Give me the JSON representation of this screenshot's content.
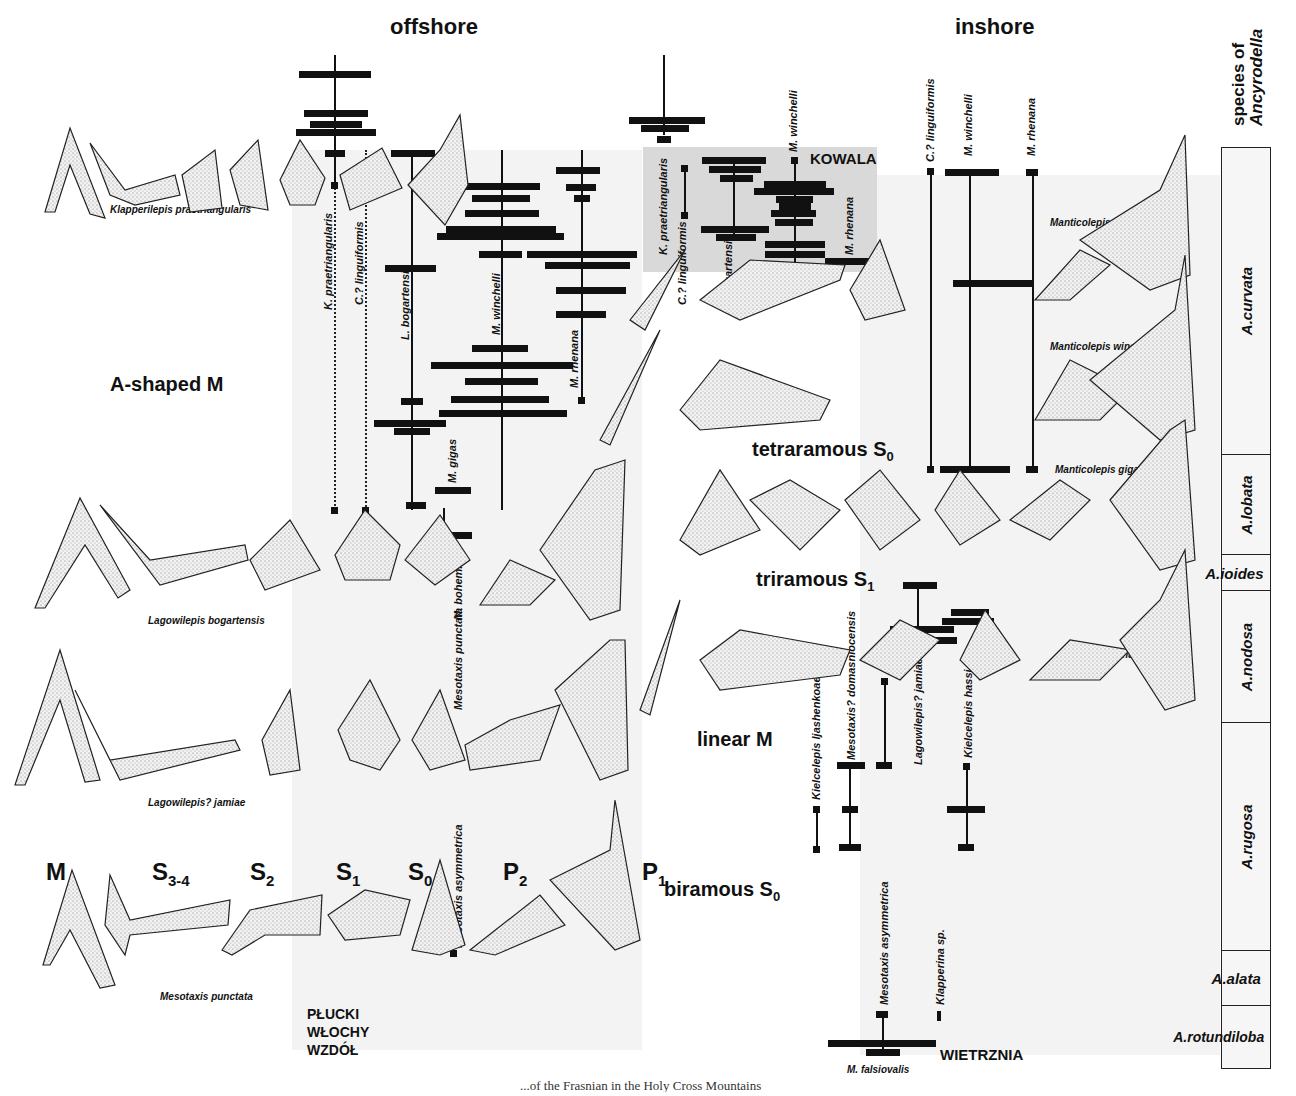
{
  "figure": {
    "headings": {
      "offshore": "offshore",
      "inshore": "inshore",
      "zone_column_title_line1": "species of",
      "zone_column_title_line2": "Ancyrodella"
    },
    "morphotype_labels": {
      "a_shaped_m": "A-shaped M",
      "tetraramous_s0": "tetraramous S",
      "tetraramous_s0_sub": "0",
      "triramous_s1": "triramous S",
      "triramous_s1_sub": "1",
      "linear_m": "linear M",
      "biramous_s0": "biramous S",
      "biramous_s0_sub": "0"
    },
    "element_labels": [
      {
        "main": "M",
        "sub": ""
      },
      {
        "main": "S",
        "sub": "3-4"
      },
      {
        "main": "S",
        "sub": "2"
      },
      {
        "main": "S",
        "sub": "1"
      },
      {
        "main": "S",
        "sub": "0"
      },
      {
        "main": "P",
        "sub": "2"
      },
      {
        "main": "P",
        "sub": "1"
      }
    ],
    "species_captions": {
      "klapperilepis": "Klapperilepis praetriangularis",
      "lagowilepis_bog": "Lagowilepis bogartensis",
      "lagowilepis_jam": "Lagowilepis? jamiae",
      "mesotaxis_punc": "Mesotaxis punctata",
      "manticolepis_rhen": "Manticolepis rhenana",
      "manticolepis_winch": "Manticolepis winchelli",
      "manticolepis_gigas": "Manticolepis gigas",
      "kielcelepis_hassi": "Kielcelepis hassi",
      "m_falsiovalis": "M. falsiovalis"
    },
    "localities": {
      "kowala": "KOWALA",
      "plucki": "PŁUCKI",
      "wlochy": "WŁOCHY",
      "wzdol": "WZDÓŁ",
      "wietrznia": "WIETRZNIA"
    },
    "range_labels": {
      "offshore": [
        "K. praetriangularis",
        "C.? linguiformis",
        "L. bogartensis",
        "M. winchelli",
        "M. rhenana",
        "M. gigas",
        "M. bohemica",
        "Mesotaxis punctata",
        "Mesotaxis asymmetrica"
      ],
      "kowala": [
        "K. praetriangularis",
        "C.? linguiformis",
        "L. bogartensis",
        "M. winchelli",
        "M. rhenana"
      ],
      "inshore": [
        "C.? linguiformis",
        "M. winchelli",
        "M. rhenana"
      ],
      "lower_inshore": [
        "Kielcelepis ljashenkoae",
        "Mesotaxis? domasniocensis",
        "Lagowilepis? jamiae",
        "Kielcelepis hassi"
      ],
      "wietrznia": [
        "Mesotaxis asymmetrica",
        "Klapperina sp."
      ]
    },
    "ancyrodella_zones": [
      {
        "name": "A.curvata"
      },
      {
        "name": "A.lobata"
      },
      {
        "name": "A.ioides"
      },
      {
        "name": "A.nodosa"
      },
      {
        "name": "A.rugosa"
      },
      {
        "name": "A.alata"
      },
      {
        "name": "A.rotundiloba"
      }
    ],
    "caption_fragment": "...of the Frasnian in the Holy Cross Mountains"
  }
}
